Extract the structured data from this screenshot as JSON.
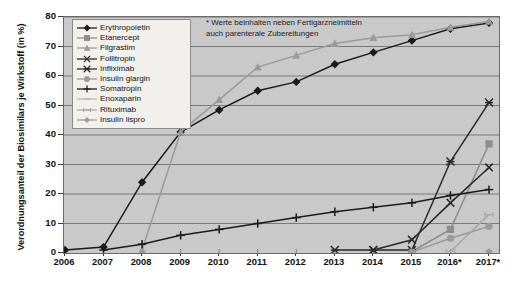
{
  "chart_data": {
    "type": "line",
    "title": "",
    "xlabel": "",
    "ylabel": "Verordnungsanteil der Biosimilars je Wirkstoff (in %)",
    "ylim": [
      0,
      80
    ],
    "ytick_values": [
      0,
      10,
      20,
      30,
      40,
      50,
      60,
      70,
      80
    ],
    "ytick_labels": [
      "0",
      "10",
      "20",
      "30",
      "40",
      "50",
      "60",
      "70",
      "80"
    ],
    "categories": [
      "2006",
      "2007",
      "2008",
      "2009",
      "2010",
      "2011",
      "2012",
      "2013",
      "2014",
      "2015",
      "2016*",
      "2017*"
    ],
    "x": [
      2006,
      2007,
      2008,
      2009,
      2010,
      2011,
      2012,
      2013,
      2014,
      2015,
      2016,
      2017
    ],
    "grid": "horizontal",
    "legend_position": "top-left",
    "annotation": "* Werte beinhalten neben Fertigarzneimitteln\nauch parenterale Zubereitungen",
    "series": [
      {
        "name": "Erythropoietin",
        "marker": "diamond",
        "color": "#1b1b1b",
        "values": [
          1,
          2,
          24,
          41,
          48.5,
          55,
          58,
          64,
          68,
          72,
          76,
          78
        ]
      },
      {
        "name": "Etanercept",
        "marker": "square",
        "color": "#8d8d8d",
        "values": [
          null,
          null,
          null,
          null,
          null,
          null,
          null,
          null,
          null,
          0.5,
          8,
          37
        ]
      },
      {
        "name": "Filgrastim",
        "marker": "triangle",
        "color": "#9a9a9a",
        "values": [
          null,
          null,
          1,
          41,
          52,
          63,
          67,
          71,
          73,
          74,
          76.5,
          78.5
        ]
      },
      {
        "name": "Follitropin",
        "marker": "x",
        "color": "#2a2a2a",
        "values": [
          null,
          null,
          null,
          null,
          null,
          null,
          null,
          null,
          1,
          4.5,
          17,
          29
        ]
      },
      {
        "name": "Infliximab",
        "marker": "asterisk",
        "color": "#2a2a2a",
        "values": [
          null,
          null,
          null,
          null,
          null,
          null,
          null,
          1,
          1,
          1,
          31,
          51
        ]
      },
      {
        "name": "Insulin glargin",
        "marker": "circle",
        "color": "#9a9a9a",
        "values": [
          null,
          null,
          null,
          null,
          null,
          null,
          null,
          null,
          null,
          0.3,
          5,
          9
        ]
      },
      {
        "name": "Somatropin",
        "marker": "plus",
        "color": "#1b1b1b",
        "values": [
          null,
          1,
          3,
          6,
          8,
          10,
          12,
          14,
          15.5,
          17,
          19.5,
          21.5
        ]
      },
      {
        "name": "Enoxaparin",
        "marker": "hbar",
        "color": "#b5b5b5",
        "values": [
          null,
          null,
          null,
          null,
          null,
          null,
          null,
          null,
          null,
          null,
          null,
          0.4
        ]
      },
      {
        "name": "Rituximab",
        "marker": "hbar2",
        "color": "#a8a8a8",
        "values": [
          null,
          null,
          null,
          null,
          null,
          null,
          null,
          null,
          null,
          null,
          0.5,
          13
        ]
      },
      {
        "name": "Insulin lispro",
        "marker": "smalldiamond",
        "color": "#9a9a9a",
        "values": [
          null,
          null,
          null,
          null,
          null,
          null,
          null,
          null,
          null,
          null,
          null,
          0.5
        ]
      }
    ]
  }
}
